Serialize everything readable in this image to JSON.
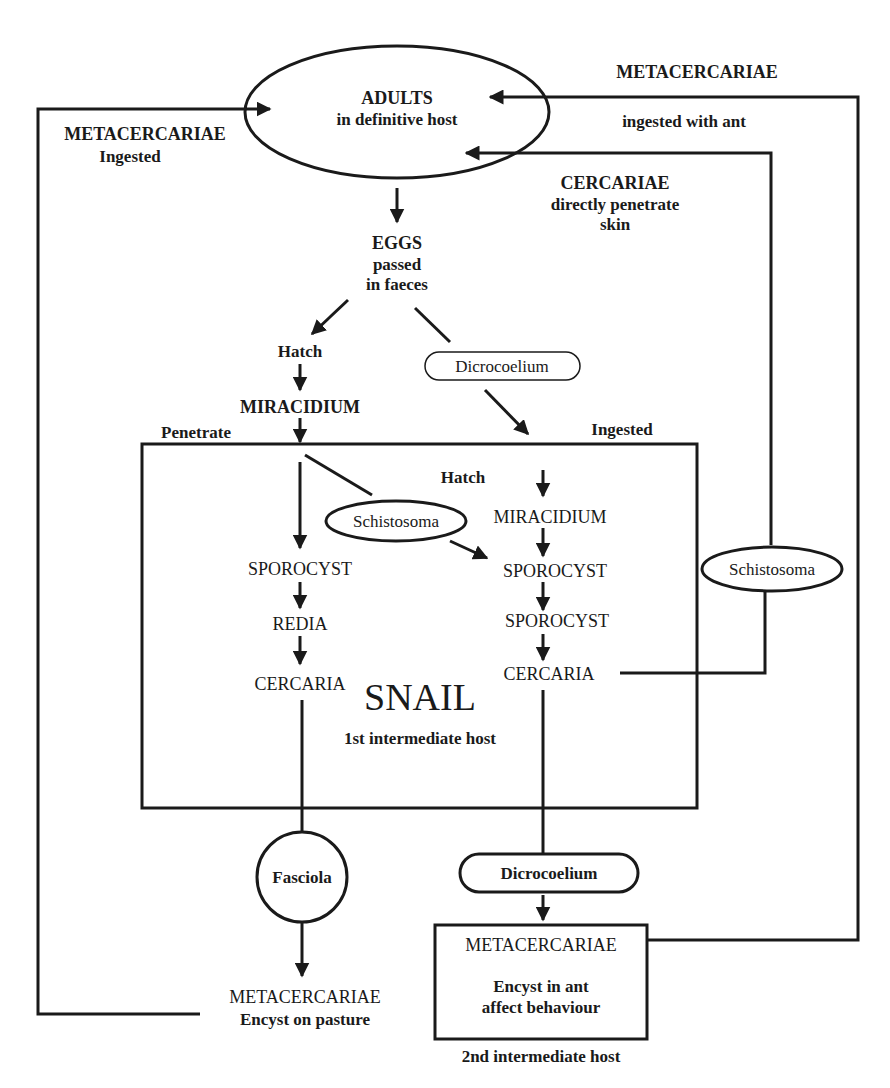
{
  "diagram": {
    "nodes": {
      "adults": {
        "label": "ADULTS",
        "sub": "in definitive host"
      },
      "eggs": {
        "label": "EGGS",
        "sub1": "passed",
        "sub2": "in faeces"
      },
      "hatch_left": "Hatch",
      "miracidium_left": "MIRACIDIUM",
      "penetrate": "Penetrate",
      "ingested_snail": "Ingested",
      "dicrocoelium_top": "Dicrocoelium",
      "hatch_right": "Hatch",
      "miracidium_right": "MIRACIDIUM",
      "schistosoma_inner": "Schistosoma",
      "sporocyst_left": "SPOROCYST",
      "redia": "REDIA",
      "cercaria_left": "CERCARIA",
      "sporocyst_right_1": "SPOROCYST",
      "sporocyst_right_2": "SPOROCYST",
      "cercaria_right": "CERCARIA",
      "snail": {
        "label": "SNAIL",
        "sub": "1st intermediate host"
      },
      "schistosoma_outer": "Schistosoma",
      "fasciola": "Fasciola",
      "metacercariae_pasture": {
        "label": "METACERCARIAE",
        "sub": "Encyst on pasture"
      },
      "dicrocoelium_bottom": "Dicrocoelium",
      "metacercariae_ant": {
        "label": "METACERCARIAE",
        "sub1": "Encyst in ant",
        "sub2": "affect behaviour"
      },
      "second_host": "2nd intermediate host"
    },
    "edge_labels": {
      "metacercariae_ingested": {
        "label": "METACERCARIAE",
        "sub": "Ingested"
      },
      "metacercariae_ant_ingested": {
        "label": "METACERCARIAE",
        "sub": "ingested with ant"
      },
      "cercariae_penetrate": {
        "label": "CERCARIAE",
        "sub1": "directly penetrate",
        "sub2": "skin"
      }
    },
    "colors": {
      "ink": "#1a1a1a",
      "background": "#ffffff"
    }
  }
}
